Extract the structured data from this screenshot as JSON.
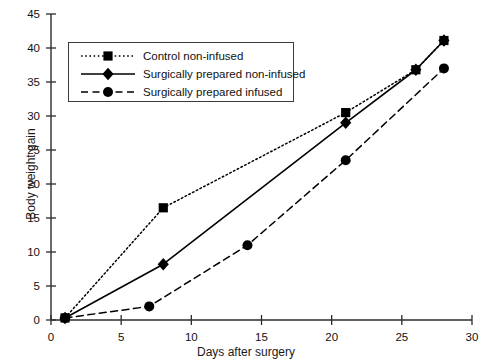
{
  "chart_data": {
    "type": "line",
    "title": "",
    "xlabel": "Days after surgery",
    "ylabel": "Body weight gain",
    "xlim": [
      0,
      30
    ],
    "ylim": [
      0,
      45
    ],
    "xticks": [
      0,
      5,
      10,
      15,
      20,
      25,
      30
    ],
    "yticks": [
      0,
      5,
      10,
      15,
      20,
      25,
      30,
      35,
      40,
      45
    ],
    "grid": false,
    "legend_position": "upper-left-inside",
    "series": [
      {
        "name": "Control non-infused",
        "marker": "square",
        "linestyle": "dotted",
        "color": "#000000",
        "x": [
          1,
          8,
          21,
          26,
          28
        ],
        "y": [
          0.3,
          16.5,
          30.5,
          36.8,
          41.1
        ]
      },
      {
        "name": "Surgically prepared non-infused",
        "marker": "diamond",
        "linestyle": "solid",
        "color": "#000000",
        "x": [
          1,
          8,
          21,
          26,
          28
        ],
        "y": [
          0.3,
          8.2,
          29.0,
          36.8,
          41.1
        ]
      },
      {
        "name": "Surgically prepared infused",
        "marker": "circle",
        "linestyle": "dashed",
        "color": "#000000",
        "x": [
          1,
          7,
          14,
          21,
          28
        ],
        "y": [
          0.3,
          2.0,
          11.0,
          23.5,
          37.0
        ]
      }
    ]
  },
  "axes": {
    "y_title": "Body weight gain",
    "x_title": "Days after surgery",
    "y_tick_labels": [
      "0",
      "5",
      "10",
      "15",
      "20",
      "25",
      "30",
      "35",
      "40",
      "45"
    ],
    "x_tick_labels": [
      "0",
      "5",
      "10",
      "15",
      "20",
      "25",
      "30"
    ]
  },
  "legend": {
    "entries": [
      {
        "label": "Control non-infused"
      },
      {
        "label": "Surgically prepared non-infused"
      },
      {
        "label": "Surgically prepared infused"
      }
    ]
  }
}
